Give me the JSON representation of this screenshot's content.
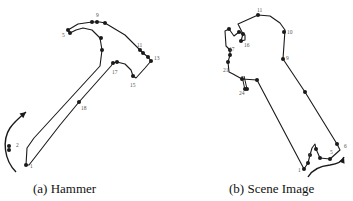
{
  "figure": {
    "panels": [
      {
        "id": "a",
        "caption": "(a) Hammer",
        "outline": [
          [
            26,
            165
          ],
          [
            27,
            148
          ],
          [
            34,
            138
          ],
          [
            100,
            66
          ],
          [
            102,
            50
          ],
          [
            100,
            38
          ],
          [
            92,
            30
          ],
          [
            83,
            28
          ],
          [
            76,
            30
          ],
          [
            70,
            33
          ],
          [
            68,
            30
          ],
          [
            78,
            24
          ],
          [
            92,
            22
          ],
          [
            100,
            22
          ],
          [
            105,
            23
          ],
          [
            125,
            35
          ],
          [
            140,
            50
          ],
          [
            143,
            53
          ],
          [
            148,
            57
          ],
          [
            151,
            61
          ],
          [
            145,
            68
          ],
          [
            136,
            78
          ],
          [
            133,
            76
          ],
          [
            131,
            70
          ],
          [
            125,
            64
          ],
          [
            117,
            62
          ],
          [
            113,
            63
          ],
          [
            111,
            66
          ],
          [
            79,
            102
          ],
          [
            60,
            125
          ],
          [
            29,
            165
          ],
          [
            26,
            165
          ]
        ],
        "points": [
          [
            26,
            165
          ],
          [
            9,
            146
          ],
          [
            9,
            150
          ],
          [
            70,
            33
          ],
          [
            68,
            30
          ],
          [
            92,
            22
          ],
          [
            97,
            22
          ],
          [
            105,
            23
          ],
          [
            101,
            38
          ],
          [
            102,
            50
          ],
          [
            140,
            50
          ],
          [
            143,
            53
          ],
          [
            148,
            57
          ],
          [
            151,
            61
          ],
          [
            133,
            76
          ],
          [
            113,
            63
          ],
          [
            117,
            62
          ],
          [
            79,
            102
          ]
        ],
        "labels": [
          {
            "text": "1",
            "x": 30,
            "y": 168
          },
          {
            "text": "2",
            "x": 16,
            "y": 147
          },
          {
            "text": "5",
            "x": 62,
            "y": 37
          },
          {
            "text": "9",
            "x": 96,
            "y": 17
          },
          {
            "text": "11",
            "x": 137,
            "y": 47
          },
          {
            "text": "13",
            "x": 154,
            "y": 60
          },
          {
            "text": "15",
            "x": 130,
            "y": 87
          },
          {
            "text": "17",
            "x": 112,
            "y": 74
          },
          {
            "text": "18",
            "x": 81,
            "y": 110
          }
        ],
        "arrow": {
          "path": "M16,172 C4,160 2,140 10,128 C14,122 20,117 26,112",
          "head": [
            26,
            112
          ]
        }
      },
      {
        "id": "b",
        "caption": "(b) Scene Image",
        "outline": [
          [
            304,
            169
          ],
          [
            257,
            80
          ],
          [
            242,
            79
          ],
          [
            233,
            74
          ],
          [
            229,
            72
          ],
          [
            228,
            62
          ],
          [
            230,
            55
          ],
          [
            230,
            50
          ],
          [
            226,
            46
          ],
          [
            225,
            31
          ],
          [
            229,
            29
          ],
          [
            234,
            36
          ],
          [
            239,
            32
          ],
          [
            245,
            35
          ],
          [
            245,
            40
          ],
          [
            241,
            41
          ],
          [
            243,
            34
          ],
          [
            238,
            24
          ],
          [
            258,
            15
          ],
          [
            270,
            16
          ],
          [
            280,
            23
          ],
          [
            285,
            30
          ],
          [
            283,
            59
          ],
          [
            305,
            92
          ],
          [
            337,
            144
          ],
          [
            340,
            150
          ],
          [
            330,
            159
          ],
          [
            320,
            158
          ],
          [
            316,
            149
          ],
          [
            315,
            144
          ],
          [
            312,
            148
          ],
          [
            310,
            155
          ],
          [
            308,
            163
          ],
          [
            304,
            169
          ]
        ],
        "points": [
          [
            304,
            169
          ],
          [
            308,
            163
          ],
          [
            310,
            155
          ],
          [
            316,
            149
          ],
          [
            320,
            158
          ],
          [
            330,
            159
          ],
          [
            337,
            144
          ],
          [
            305,
            92
          ],
          [
            283,
            59
          ],
          [
            284,
            32
          ],
          [
            258,
            15
          ],
          [
            239,
            32
          ],
          [
            243,
            34
          ],
          [
            241,
            41
          ],
          [
            229,
            29
          ],
          [
            230,
            50
          ],
          [
            230,
            55
          ],
          [
            228,
            62
          ],
          [
            242,
            79
          ],
          [
            247,
            89
          ],
          [
            245,
            89
          ],
          [
            257,
            80
          ]
        ],
        "labels": [
          {
            "text": "1",
            "x": 298,
            "y": 172
          },
          {
            "text": "3",
            "x": 308,
            "y": 157
          },
          {
            "text": "5",
            "x": 330,
            "y": 154
          },
          {
            "text": "6",
            "x": 344,
            "y": 148
          },
          {
            "text": "9",
            "x": 286,
            "y": 60
          },
          {
            "text": "10",
            "x": 287,
            "y": 34
          },
          {
            "text": "11",
            "x": 257,
            "y": 12
          },
          {
            "text": "16",
            "x": 244,
            "y": 47
          },
          {
            "text": "17",
            "x": 229,
            "y": 51
          },
          {
            "text": "21",
            "x": 223,
            "y": 72
          },
          {
            "text": "24",
            "x": 239,
            "y": 95
          }
        ],
        "spur": [
          [
            242,
            76
          ],
          [
            245,
            90
          ],
          [
            247,
            89
          ],
          [
            244,
            76
          ]
        ],
        "arrow": {
          "path": "M308,177 C312,170 320,166 330,165 C338,164 342,162 344,157",
          "head": [
            344,
            157
          ]
        }
      }
    ],
    "colors": {
      "ink": "#1a1a1a",
      "label": "#555555",
      "background": "#ffffff"
    }
  }
}
